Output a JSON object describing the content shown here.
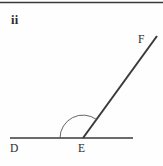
{
  "figure": {
    "part_label": "ii",
    "background_color": "#fefefe",
    "stroke_color": "#3a3a3a",
    "label_color": "#2b2b2b",
    "top_rule": {
      "x1": 0,
      "y1": 2.5,
      "x2": 163,
      "y2": 2.5,
      "width": 1.6
    },
    "points": {
      "D": {
        "label": "D",
        "x": 10,
        "y": 138
      },
      "E": {
        "label": "E",
        "x": 83,
        "y": 138
      },
      "F": {
        "label": "F",
        "x": 157,
        "y": 36
      }
    },
    "segments": [
      {
        "name": "ray-ED-baseline",
        "x1": 10,
        "y1": 138,
        "x2": 133,
        "y2": 138,
        "width": 1.7
      },
      {
        "name": "ray-EF",
        "x1": 83,
        "y1": 138,
        "x2": 157,
        "y2": 36,
        "width": 2.0
      }
    ],
    "angle_arc": {
      "vertex": "E",
      "radius": 23,
      "start_x": 60,
      "start_y": 138,
      "end_x": 96.4,
      "end_y": 119.4,
      "width": 0.9,
      "sweep_flag": 1,
      "large_arc_flag": 0
    }
  }
}
